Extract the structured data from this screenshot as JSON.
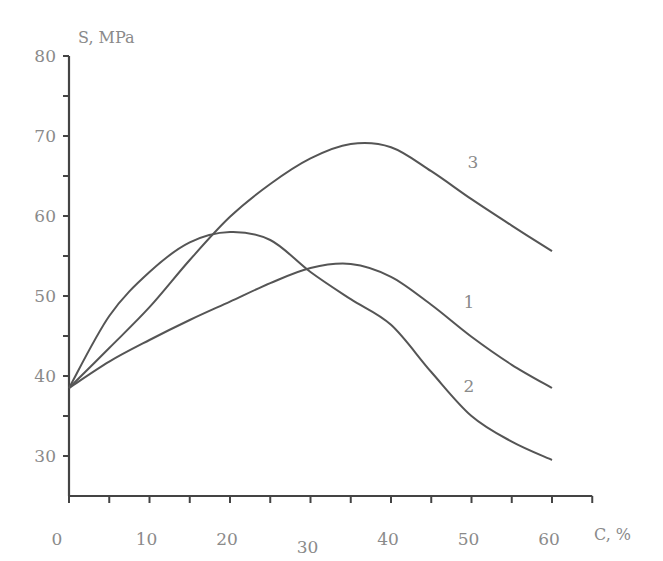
{
  "chart_data": {
    "type": "line",
    "title": "",
    "xlabel": "C, %",
    "ylabel": "S, MPa",
    "xlim": [
      0,
      65
    ],
    "ylim": [
      25,
      80
    ],
    "grid": false,
    "legend": "inline curve labels",
    "x_ticks": [
      0,
      10,
      20,
      30,
      40,
      50,
      60
    ],
    "x_tick_labels": [
      "0",
      "10",
      "20",
      "30",
      "40",
      "50",
      "60"
    ],
    "x_minor_ticks": [
      5,
      15,
      25,
      35,
      45,
      55,
      65
    ],
    "y_ticks": [
      30,
      40,
      50,
      60,
      70,
      80
    ],
    "y_tick_labels": [
      "30",
      "40",
      "50",
      "60",
      "70",
      "80"
    ],
    "y_minor_ticks": [
      35,
      45,
      55,
      65,
      75
    ],
    "x": [
      0,
      5,
      10,
      15,
      20,
      25,
      30,
      35,
      40,
      45,
      50,
      55,
      60
    ],
    "series": [
      {
        "name": "1",
        "values": [
          38.5,
          41.8,
          44.5,
          47.0,
          49.3,
          51.6,
          53.5,
          54.0,
          52.4,
          48.9,
          44.9,
          41.4,
          38.5
        ]
      },
      {
        "name": "2",
        "values": [
          38.5,
          47.5,
          53.0,
          56.7,
          58.0,
          57.0,
          53.0,
          49.6,
          46.4,
          40.5,
          35.0,
          31.8,
          29.5
        ]
      },
      {
        "name": "3",
        "values": [
          38.5,
          43.5,
          48.6,
          54.5,
          59.9,
          64.0,
          67.2,
          69.0,
          68.6,
          65.6,
          62.1,
          58.8,
          55.6
        ]
      }
    ],
    "annotations": [
      {
        "text": "1",
        "x": 49,
        "y": 48.5
      },
      {
        "text": "2",
        "x": 49,
        "y": 38
      },
      {
        "text": "3",
        "x": 49.5,
        "y": 66
      }
    ]
  },
  "labels": {
    "y_axis_title": "S, MPa",
    "x_axis_title": "C, %"
  }
}
